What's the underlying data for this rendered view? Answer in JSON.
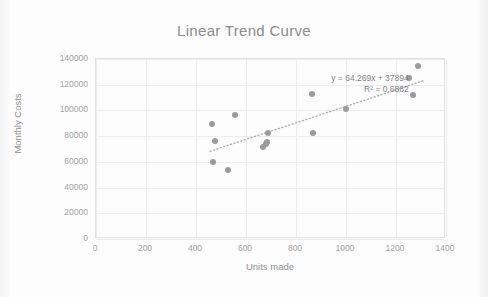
{
  "chart_data": {
    "type": "scatter",
    "title": "Linear Trend Curve",
    "xlabel": "Units made",
    "ylabel": "Monthly Costs",
    "xlim": [
      0,
      1400
    ],
    "ylim": [
      0,
      140000
    ],
    "xticks": [
      0,
      200,
      400,
      600,
      800,
      1000,
      1200,
      1400
    ],
    "yticks": [
      0,
      20000,
      40000,
      60000,
      80000,
      100000,
      120000,
      140000
    ],
    "xtick_labels": [
      "0",
      "200",
      "400",
      "600",
      "800",
      "1000",
      "1200",
      "1400"
    ],
    "ytick_labels": [
      "0",
      "20000",
      "40000",
      "60000",
      "80000",
      "100000",
      "120000",
      "140000"
    ],
    "grid": true,
    "legend": "none",
    "marker_color": "#9b9b9b",
    "trendline_color": "#a8a8a8",
    "trendline_style": "dotted",
    "points": [
      {
        "x": 468,
        "y": 89000
      },
      {
        "x": 478,
        "y": 75500
      },
      {
        "x": 470,
        "y": 59500
      },
      {
        "x": 530,
        "y": 53000
      },
      {
        "x": 560,
        "y": 96000
      },
      {
        "x": 672,
        "y": 70500
      },
      {
        "x": 682,
        "y": 73000
      },
      {
        "x": 686,
        "y": 74800
      },
      {
        "x": 690,
        "y": 82000
      },
      {
        "x": 866,
        "y": 112000
      },
      {
        "x": 870,
        "y": 81500
      },
      {
        "x": 1004,
        "y": 100500
      },
      {
        "x": 1256,
        "y": 124500
      },
      {
        "x": 1272,
        "y": 111500
      },
      {
        "x": 1292,
        "y": 133500
      }
    ],
    "trendline": {
      "slope": 64.269,
      "intercept": 37894,
      "r_squared": 0.6882,
      "x_start": 460,
      "x_end": 1320
    },
    "annotations": {
      "equation": "y = 64.269x + 37894",
      "r_squared_label": "R² = 0.6882"
    }
  }
}
